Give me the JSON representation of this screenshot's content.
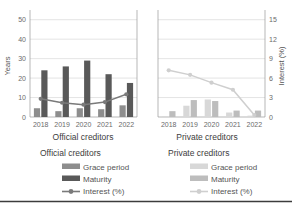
{
  "chart_data": {
    "type": "bar",
    "title": "",
    "subtitle": "",
    "grid": true,
    "legend_position": "bottom",
    "axes": {
      "left": {
        "ylabel": "Years",
        "ticks": [
          0,
          10,
          20,
          30,
          40,
          50
        ],
        "ylim": [
          0,
          55
        ]
      },
      "right": {
        "ylabel": "Interest (%)",
        "ticks": [
          0,
          3,
          6,
          9,
          12,
          15
        ],
        "ylim": [
          0,
          16.5
        ]
      },
      "xlabel": "",
      "categories": [
        "2018",
        "2019",
        "2020",
        "2021",
        "2022"
      ]
    },
    "panels": [
      {
        "name": "Official creditors",
        "title": "Official creditors",
        "categories": [
          "2018",
          "2019",
          "2020",
          "2021",
          "2022"
        ],
        "series": [
          {
            "name": "Grace period",
            "type": "bar",
            "axis": "left",
            "unit": "years",
            "color": "#8d8d8d",
            "values": [
              4.5,
              3.0,
              4.5,
              4.0,
              6.0
            ]
          },
          {
            "name": "Maturity",
            "type": "bar",
            "axis": "left",
            "unit": "years",
            "color": "#595959",
            "values": [
              24.0,
              26.0,
              29.0,
              22.0,
              17.5
            ]
          },
          {
            "name": "Interest (%)",
            "type": "line",
            "axis": "right",
            "unit": "percent",
            "color": "#7a7a7a",
            "values": [
              2.8,
              2.2,
              1.9,
              2.3,
              3.5
            ]
          }
        ]
      },
      {
        "name": "Private creditors",
        "title": "Private creditors",
        "categories": [
          "2018",
          "2019",
          "2020",
          "2021",
          "2022"
        ],
        "series": [
          {
            "name": "Grace period",
            "type": "bar",
            "axis": "left",
            "unit": "years",
            "color": "#d8d8d8",
            "values": [
              0.3,
              5.8,
              9.0,
              2.3,
              0.7
            ]
          },
          {
            "name": "Maturity",
            "type": "bar",
            "axis": "left",
            "unit": "years",
            "color": "#bdbdbd",
            "values": [
              3.0,
              8.7,
              8.2,
              3.3,
              3.3
            ]
          },
          {
            "name": "Interest (%)",
            "type": "line",
            "axis": "right",
            "unit": "percent",
            "color": "#cfcfcf",
            "values": [
              7.2,
              6.5,
              5.3,
              4.2,
              0.3
            ]
          }
        ]
      }
    ]
  },
  "axis": {
    "left_title": "Years",
    "right_title": "Interest (%)",
    "left_ticks": [
      "50",
      "40",
      "30",
      "20",
      "10",
      "0"
    ],
    "right_ticks": [
      "15",
      "12",
      "9",
      "6",
      "3",
      "0"
    ]
  },
  "panel_titles": {
    "official": "Official creditors",
    "private": "Private creditors"
  },
  "xticks": {
    "official": [
      "2018",
      "2019",
      "2020",
      "2021",
      "2022"
    ],
    "private": [
      "2018",
      "2019",
      "2020",
      "2021",
      "2022"
    ]
  },
  "legend": {
    "official": {
      "heading": "Official creditors",
      "items": [
        {
          "label": "Grace period",
          "marker": "swatch-icon"
        },
        {
          "label": "Maturity",
          "marker": "swatch-icon"
        },
        {
          "label": "Interest (%)",
          "marker": "line-marker-icon"
        }
      ]
    },
    "private": {
      "heading": "Private creditors",
      "items": [
        {
          "label": "Grace period",
          "marker": "swatch-icon"
        },
        {
          "label": "Maturity",
          "marker": "swatch-icon"
        },
        {
          "label": "Interest (%)",
          "marker": "line-marker-icon"
        }
      ]
    }
  },
  "colors": {
    "official_grace": "#8d8d8d",
    "official_maturity": "#595959",
    "official_interest": "#7a7a7a",
    "private_grace": "#d8d8d8",
    "private_maturity": "#bdbdbd",
    "private_interest": "#cfcfcf",
    "grid": "#d9d9d9",
    "axis": "#9a9a9a",
    "text": "#555555"
  }
}
